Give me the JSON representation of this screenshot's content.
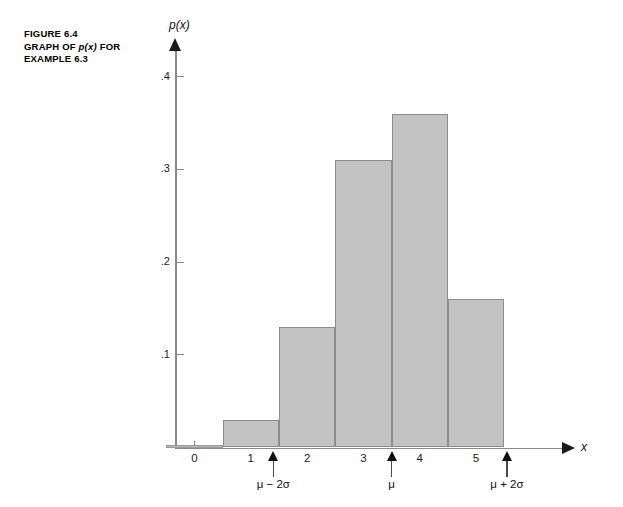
{
  "caption": {
    "figure_number": "FIGURE 6.4",
    "line2_prefix": "GRAPH OF ",
    "line2_italic": "p(x)",
    "line2_suffix": " FOR",
    "line3": "EXAMPLE 6.3"
  },
  "colors": {
    "bar_fill": "#c3c3c3",
    "bar_stroke": "#8c8c8c",
    "axis": "#8a8a8a",
    "text": "#111111"
  },
  "chart_data": {
    "type": "bar",
    "title": "GRAPH OF p(x) FOR EXAMPLE 6.3",
    "xlabel": "x",
    "ylabel": "p(x)",
    "categories": [
      "0",
      "1",
      "2",
      "3",
      "4",
      "5"
    ],
    "values": [
      0.0,
      0.03,
      0.13,
      0.31,
      0.36,
      0.16
    ],
    "bar_width": 1,
    "xlim": [
      -0.5,
      6.4
    ],
    "ylim": [
      0,
      0.44
    ],
    "xticks": [
      "0",
      "1",
      "2",
      "3",
      "4",
      "5"
    ],
    "yticks": [
      ".1",
      ".2",
      ".3",
      ".4"
    ],
    "ytick_values": [
      0.1,
      0.2,
      0.3,
      0.4
    ],
    "grid": false,
    "legend": "none",
    "annotations": [
      {
        "label": "μ − 2σ",
        "x": 1.4
      },
      {
        "label": "μ",
        "x": 3.5
      },
      {
        "label": "μ + 2σ",
        "x": 5.55
      }
    ]
  }
}
